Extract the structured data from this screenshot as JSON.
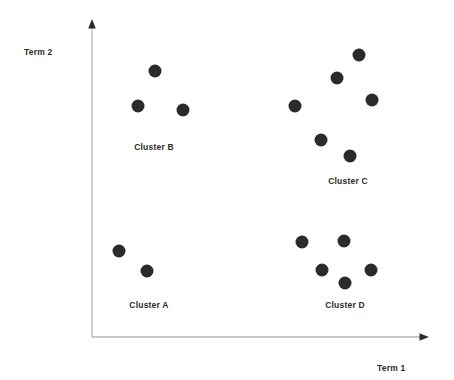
{
  "chart_data": {
    "type": "scatter",
    "title": "",
    "subtitle": "",
    "xlabel": "Term 1",
    "ylabel": "Term 2",
    "xlim": [
      0,
      100
    ],
    "ylim": [
      0,
      100
    ],
    "grid": false,
    "legend": false,
    "axis_style": "arrow",
    "marker": {
      "shape": "circle",
      "diameter_px": 13,
      "color": "#2b2b2b"
    },
    "colors": {
      "marker": "#2b2b2b",
      "axis": "#b5b5b5",
      "text": "#2b2b2b",
      "background": "#ffffff"
    },
    "axes_px": {
      "origin_x": 92,
      "origin_y": 337,
      "y_top": 22,
      "x_right": 428
    },
    "series": [
      {
        "name": "Cluster B",
        "label_px": {
          "x": 154,
          "y": 148
        },
        "points_px": [
          {
            "x": 155,
            "y": 71
          },
          {
            "x": 138,
            "y": 106
          },
          {
            "x": 183,
            "y": 110
          }
        ],
        "points_data": [
          {
            "x": 18.8,
            "y": 84.4
          },
          {
            "x": 13.7,
            "y": 73.3
          },
          {
            "x": 27.1,
            "y": 72.1
          }
        ],
        "count": 3
      },
      {
        "name": "Cluster C",
        "label_px": {
          "x": 348,
          "y": 182
        },
        "points_px": [
          {
            "x": 359,
            "y": 55
          },
          {
            "x": 337,
            "y": 78
          },
          {
            "x": 372,
            "y": 100
          },
          {
            "x": 295,
            "y": 106
          },
          {
            "x": 321,
            "y": 140
          },
          {
            "x": 350,
            "y": 156
          }
        ],
        "points_data": [
          {
            "x": 79.5,
            "y": 89.5
          },
          {
            "x": 72.9,
            "y": 82.2
          },
          {
            "x": 83.3,
            "y": 75.2
          },
          {
            "x": 60.4,
            "y": 73.3
          },
          {
            "x": 68.2,
            "y": 62.5
          },
          {
            "x": 76.8,
            "y": 57.5
          }
        ],
        "count": 6
      },
      {
        "name": "Cluster A",
        "label_px": {
          "x": 149,
          "y": 306
        },
        "points_px": [
          {
            "x": 119,
            "y": 251
          },
          {
            "x": 147,
            "y": 271
          }
        ],
        "points_data": [
          {
            "x": 8.0,
            "y": 27.3
          },
          {
            "x": 16.4,
            "y": 21.0
          }
        ],
        "count": 2
      },
      {
        "name": "Cluster D",
        "label_px": {
          "x": 345,
          "y": 306
        },
        "points_px": [
          {
            "x": 302,
            "y": 242
          },
          {
            "x": 344,
            "y": 241
          },
          {
            "x": 322,
            "y": 270
          },
          {
            "x": 371,
            "y": 270
          },
          {
            "x": 345,
            "y": 283
          }
        ],
        "points_data": [
          {
            "x": 62.5,
            "y": 30.2
          },
          {
            "x": 75.0,
            "y": 30.5
          },
          {
            "x": 68.5,
            "y": 21.3
          },
          {
            "x": 83.0,
            "y": 21.3
          },
          {
            "x": 75.3,
            "y": 17.1
          }
        ],
        "count": 5
      }
    ]
  },
  "axis": {
    "x_label": "Term 1",
    "y_label": "Term 2"
  },
  "clusters": [
    {
      "label": "Cluster B"
    },
    {
      "label": "Cluster C"
    },
    {
      "label": "Cluster A"
    },
    {
      "label": "Cluster D"
    }
  ]
}
